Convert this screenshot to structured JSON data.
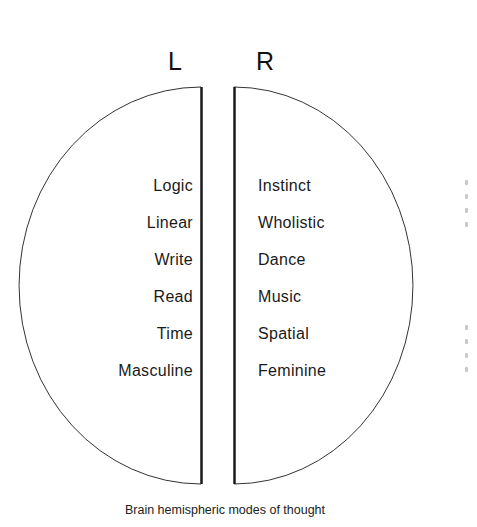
{
  "diagram": {
    "hemispheres": {
      "left": {
        "label": "L",
        "terms": [
          "Logic",
          "Linear",
          "Write",
          "Read",
          "Time",
          "Masculine"
        ]
      },
      "right": {
        "label": "R",
        "terms": [
          "Instinct",
          "Wholistic",
          "Dance",
          "Music",
          "Spatial",
          "Feminine"
        ]
      }
    },
    "caption": "Brain hemispheric modes of thought",
    "colors": {
      "outline": "#222222",
      "text": "#1a1a1a",
      "background": "#ffffff"
    }
  }
}
